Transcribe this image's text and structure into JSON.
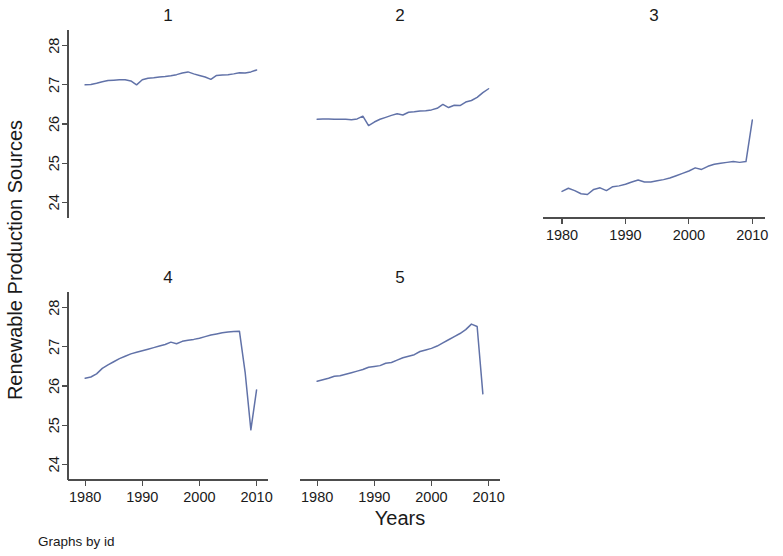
{
  "figure": {
    "note": "Graphs by id",
    "ylabel": "Renewable Production Sources",
    "xlabel": "Years"
  },
  "chart_data": {
    "type": "line",
    "title": "",
    "subtitle": "",
    "xlabel": "Years",
    "ylabel": "Renewable Production Sources",
    "note": "Graphs by id",
    "grid": false,
    "legend": "none",
    "layout": "small-multiples 3 columns x 2 rows",
    "panel_titles": [
      "1",
      "2",
      "3",
      "4",
      "5"
    ],
    "xlim": [
      1977,
      2012
    ],
    "ylim": [
      23.6,
      28.4
    ],
    "xticks": [
      1980,
      1990,
      2000,
      2010
    ],
    "xtick_labels": [
      "1980",
      "1990",
      "2000",
      "2010"
    ],
    "yticks": [
      24,
      25,
      26,
      27,
      28
    ],
    "ytick_labels": [
      "24",
      "25",
      "26",
      "27",
      "28"
    ],
    "line_color": "#6172a8",
    "panels": [
      {
        "id": "1",
        "title": "1",
        "x": [
          1980,
          1981,
          1982,
          1983,
          1984,
          1985,
          1986,
          1987,
          1988,
          1989,
          1990,
          1991,
          1992,
          1993,
          1994,
          1995,
          1996,
          1997,
          1998,
          1999,
          2000,
          2001,
          2002,
          2003,
          2004,
          2005,
          2006,
          2007,
          2008,
          2009,
          2010
        ],
        "y": [
          27.0,
          27.01,
          27.04,
          27.08,
          27.11,
          27.12,
          27.13,
          27.13,
          27.1,
          27.0,
          27.13,
          27.17,
          27.18,
          27.2,
          27.21,
          27.23,
          27.26,
          27.3,
          27.33,
          27.28,
          27.24,
          27.2,
          27.14,
          27.24,
          27.25,
          27.26,
          27.28,
          27.31,
          27.3,
          27.33,
          27.38
        ]
      },
      {
        "id": "2",
        "title": "2",
        "x": [
          1980,
          1981,
          1982,
          1983,
          1984,
          1985,
          1986,
          1987,
          1988,
          1989,
          1990,
          1991,
          1992,
          1993,
          1994,
          1995,
          1996,
          1997,
          1998,
          1999,
          2000,
          2001,
          2002,
          2003,
          2004,
          2005,
          2006,
          2007,
          2008,
          2009,
          2010
        ],
        "y": [
          26.12,
          26.13,
          26.13,
          26.12,
          26.12,
          26.12,
          26.11,
          26.13,
          26.2,
          25.96,
          26.05,
          26.12,
          26.17,
          26.22,
          26.26,
          26.23,
          26.3,
          26.31,
          26.33,
          26.34,
          26.36,
          26.4,
          26.5,
          26.42,
          26.48,
          26.47,
          26.56,
          26.6,
          26.68,
          26.8,
          26.9
        ]
      },
      {
        "id": "3",
        "title": "3",
        "x": [
          1980,
          1981,
          1982,
          1983,
          1984,
          1985,
          1986,
          1987,
          1988,
          1989,
          1990,
          1991,
          1992,
          1993,
          1994,
          1995,
          1996,
          1997,
          1998,
          1999,
          2000,
          2001,
          2002,
          2003,
          2004,
          2005,
          2006,
          2007,
          2008,
          2009,
          2010
        ],
        "y": [
          24.28,
          24.36,
          24.3,
          24.22,
          24.2,
          24.33,
          24.37,
          24.3,
          24.4,
          24.42,
          24.46,
          24.52,
          24.57,
          24.52,
          24.52,
          24.55,
          24.58,
          24.62,
          24.68,
          24.74,
          24.8,
          24.88,
          24.84,
          24.92,
          24.97,
          25.0,
          25.02,
          25.04,
          25.02,
          25.04,
          26.1
        ]
      },
      {
        "id": "4",
        "title": "4",
        "x": [
          1980,
          1981,
          1982,
          1983,
          1984,
          1985,
          1986,
          1987,
          1988,
          1989,
          1990,
          1991,
          1992,
          1993,
          1994,
          1995,
          1996,
          1997,
          1998,
          1999,
          2000,
          2001,
          2002,
          2003,
          2004,
          2005,
          2006,
          2007,
          2008,
          2009,
          2010
        ],
        "y": [
          26.2,
          26.23,
          26.31,
          26.45,
          26.54,
          26.62,
          26.7,
          26.76,
          26.82,
          26.86,
          26.9,
          26.94,
          26.98,
          27.02,
          27.06,
          27.12,
          27.08,
          27.14,
          27.17,
          27.19,
          27.22,
          27.26,
          27.3,
          27.33,
          27.36,
          27.38,
          27.39,
          27.4,
          26.35,
          24.88,
          25.9
        ]
      },
      {
        "id": "5",
        "title": "5",
        "x": [
          1980,
          1981,
          1982,
          1983,
          1984,
          1985,
          1986,
          1987,
          1988,
          1989,
          1990,
          1991,
          1992,
          1993,
          1994,
          1995,
          1996,
          1997,
          1998,
          1999,
          2000,
          2001,
          2002,
          2003,
          2004,
          2005,
          2006,
          2007,
          2008,
          2009
        ],
        "y": [
          26.12,
          26.16,
          26.2,
          26.25,
          26.26,
          26.3,
          26.34,
          26.38,
          26.42,
          26.48,
          26.5,
          26.52,
          26.58,
          26.6,
          26.66,
          26.72,
          26.76,
          26.8,
          26.88,
          26.92,
          26.96,
          27.02,
          27.1,
          27.18,
          27.26,
          27.34,
          27.44,
          27.58,
          27.52,
          25.8
        ]
      }
    ]
  }
}
